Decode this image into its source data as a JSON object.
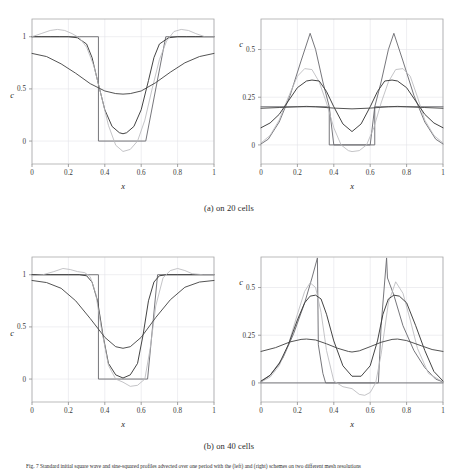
{
  "figure": {
    "subcaption_a": "(a) on 20 cells",
    "subcaption_b": "(b) on 40 cells",
    "caption_label": "Fig. 7",
    "caption_text": "Fig. 7 Standard initial square wave and sine-squared profiles advected over one period with the (left) and (right) schemes on two different mesh resolutions"
  },
  "axes": {
    "xlabel": "x",
    "ylabel": "c",
    "x_ticks": [
      "0",
      "0.2",
      "0.4",
      "0.6",
      "0.8",
      "1"
    ],
    "y_ticks_left": [
      "0",
      "0.5",
      "1"
    ],
    "y_ticks_right": [
      "0",
      "0.25",
      "0.5"
    ],
    "xlim": [
      0,
      1
    ],
    "ylim_left": [
      -0.22,
      1.17
    ],
    "ylim_right": [
      -0.1,
      0.66
    ],
    "grid": true,
    "frame_color": "#aaaaaa",
    "grid_color": "#e3e3e8"
  },
  "colors": {
    "exact": "#6f6f74",
    "compressive": "#3a3a3a",
    "oscillatory": "#b9b9bd",
    "diffusive": "#4a4a4a"
  },
  "chart_data": [
    {
      "type": "line",
      "id": "panel-top-left",
      "title": "square wave, 20 cells",
      "xlabel": "x",
      "ylabel": "c",
      "xlim": [
        0,
        1
      ],
      "ylim": [
        -0.22,
        1.17
      ],
      "x_ticks": [
        0,
        0.2,
        0.4,
        0.6,
        0.8,
        1
      ],
      "y_ticks": [
        0,
        0.5,
        1
      ],
      "grid": true,
      "legend_position": "none",
      "series": [
        {
          "name": "exact square profile",
          "color": "#6f6f74",
          "x": [
            0,
            0.26,
            0.26,
            0.365,
            0.365,
            0.625,
            0.625,
            0.735,
            0.735,
            1
          ],
          "y": [
            1,
            1,
            1,
            1,
            0,
            0,
            0,
            1,
            1,
            1
          ]
        },
        {
          "name": "compressive scheme",
          "color": "#3a3a3a",
          "x": [
            0,
            0.05,
            0.1,
            0.15,
            0.2,
            0.25,
            0.3,
            0.33,
            0.36,
            0.4,
            0.44,
            0.48,
            0.5,
            0.52,
            0.56,
            0.6,
            0.64,
            0.67,
            0.7,
            0.75,
            0.8,
            0.85,
            0.9,
            0.95,
            1
          ],
          "y": [
            1.0,
            1.0,
            1.0,
            1.0,
            1.0,
            0.99,
            0.93,
            0.8,
            0.58,
            0.3,
            0.14,
            0.08,
            0.07,
            0.08,
            0.14,
            0.3,
            0.58,
            0.8,
            0.93,
            0.99,
            1.0,
            1.0,
            1.0,
            1.0,
            1.0
          ]
        },
        {
          "name": "oscillatory scheme",
          "color": "#b9b9bd",
          "x": [
            0,
            0.05,
            0.1,
            0.14,
            0.18,
            0.22,
            0.26,
            0.3,
            0.34,
            0.38,
            0.42,
            0.46,
            0.5,
            0.54,
            0.58,
            0.62,
            0.66,
            0.7,
            0.74,
            0.78,
            0.82,
            0.86,
            0.9,
            0.95,
            1
          ],
          "y": [
            1.0,
            1.03,
            1.06,
            1.07,
            1.06,
            1.03,
            0.99,
            0.9,
            0.72,
            0.44,
            0.15,
            -0.04,
            -0.1,
            -0.08,
            0.0,
            0.2,
            0.5,
            0.78,
            0.96,
            1.05,
            1.07,
            1.06,
            1.03,
            1.0,
            1.0
          ]
        },
        {
          "name": "diffusive scheme",
          "color": "#4a4a4a",
          "x": [
            0,
            0.08,
            0.16,
            0.24,
            0.32,
            0.4,
            0.46,
            0.5,
            0.54,
            0.6,
            0.68,
            0.76,
            0.84,
            0.92,
            1
          ],
          "y": [
            0.84,
            0.81,
            0.74,
            0.65,
            0.55,
            0.48,
            0.455,
            0.45,
            0.455,
            0.48,
            0.56,
            0.66,
            0.75,
            0.81,
            0.84
          ]
        }
      ]
    },
    {
      "type": "line",
      "id": "panel-top-right",
      "title": "sine-squared profile, 20 cells",
      "xlabel": "x",
      "ylabel": "c",
      "xlim": [
        0,
        1
      ],
      "ylim": [
        -0.1,
        0.66
      ],
      "x_ticks": [
        0,
        0.2,
        0.4,
        0.6,
        0.8,
        1
      ],
      "y_ticks": [
        0,
        0.25,
        0.5
      ],
      "grid": true,
      "legend_position": "none",
      "series": [
        {
          "name": "exact square profile",
          "color": "#6f6f74",
          "x": [
            0,
            0.375,
            0.375,
            0.625,
            0.625,
            1
          ],
          "y": [
            0.2,
            0.2,
            0.0,
            0.0,
            0.2,
            0.2
          ]
        },
        {
          "name": "peaked scheme",
          "color": "#6f6f74",
          "x": [
            0,
            0.04,
            0.1,
            0.16,
            0.22,
            0.27,
            0.3,
            0.34,
            0.375,
            0.4,
            0.5,
            0.6,
            0.625,
            0.66,
            0.7,
            0.73,
            0.78,
            0.84,
            0.9,
            0.96,
            1
          ],
          "y": [
            0.005,
            0.03,
            0.12,
            0.26,
            0.44,
            0.585,
            0.5,
            0.33,
            0.2,
            0.0,
            0.0,
            0.0,
            0.2,
            0.33,
            0.5,
            0.585,
            0.44,
            0.26,
            0.12,
            0.03,
            0.005
          ]
        },
        {
          "name": "oscillatory scheme",
          "color": "#b9b9bd",
          "x": [
            0,
            0.05,
            0.1,
            0.15,
            0.2,
            0.24,
            0.28,
            0.32,
            0.36,
            0.4,
            0.44,
            0.48,
            0.5,
            0.54,
            0.58,
            0.62,
            0.66,
            0.7,
            0.74,
            0.78,
            0.82,
            0.86,
            0.9,
            0.95,
            1
          ],
          "y": [
            0.01,
            0.05,
            0.13,
            0.25,
            0.36,
            0.4,
            0.395,
            0.33,
            0.22,
            0.09,
            0.0,
            -0.03,
            -0.035,
            -0.03,
            0.0,
            0.09,
            0.22,
            0.33,
            0.395,
            0.4,
            0.36,
            0.25,
            0.13,
            0.05,
            0.01
          ]
        },
        {
          "name": "compressive scheme",
          "color": "#3a3a3a",
          "x": [
            0,
            0.05,
            0.1,
            0.15,
            0.2,
            0.25,
            0.28,
            0.32,
            0.36,
            0.4,
            0.45,
            0.5,
            0.55,
            0.6,
            0.64,
            0.68,
            0.72,
            0.75,
            0.8,
            0.85,
            0.9,
            0.95,
            1
          ],
          "y": [
            0.09,
            0.115,
            0.16,
            0.23,
            0.3,
            0.335,
            0.34,
            0.335,
            0.28,
            0.2,
            0.11,
            0.07,
            0.11,
            0.2,
            0.28,
            0.335,
            0.34,
            0.335,
            0.3,
            0.23,
            0.16,
            0.115,
            0.09
          ]
        },
        {
          "name": "diffusive scheme",
          "color": "#4a4a4a",
          "x": [
            0,
            0.1,
            0.2,
            0.25,
            0.3,
            0.4,
            0.5,
            0.6,
            0.7,
            0.75,
            0.8,
            0.9,
            1
          ],
          "y": [
            0.192,
            0.196,
            0.2,
            0.202,
            0.2,
            0.193,
            0.189,
            0.193,
            0.2,
            0.202,
            0.2,
            0.196,
            0.192
          ]
        }
      ]
    },
    {
      "type": "line",
      "id": "panel-bottom-left",
      "title": "square wave, 40 cells",
      "xlabel": "x",
      "ylabel": "c",
      "xlim": [
        0,
        1
      ],
      "ylim": [
        -0.22,
        1.17
      ],
      "x_ticks": [
        0,
        0.2,
        0.4,
        0.6,
        0.8,
        1
      ],
      "y_ticks": [
        0,
        0.5,
        1
      ],
      "grid": true,
      "legend_position": "none",
      "series": [
        {
          "name": "exact square profile",
          "color": "#6f6f74",
          "x": [
            0,
            0.31,
            0.31,
            0.365,
            0.365,
            0.635,
            0.635,
            0.69,
            0.69,
            1
          ],
          "y": [
            1,
            1,
            1,
            1,
            0,
            0,
            0,
            1,
            1,
            1
          ]
        },
        {
          "name": "compressive scheme",
          "color": "#3a3a3a",
          "x": [
            0,
            0.1,
            0.2,
            0.26,
            0.3,
            0.33,
            0.36,
            0.39,
            0.42,
            0.46,
            0.5,
            0.54,
            0.58,
            0.61,
            0.64,
            0.67,
            0.7,
            0.74,
            0.8,
            0.9,
            1
          ],
          "y": [
            1.0,
            1.0,
            1.0,
            1.0,
            0.99,
            0.93,
            0.75,
            0.42,
            0.15,
            0.04,
            0.01,
            0.04,
            0.15,
            0.42,
            0.75,
            0.93,
            0.99,
            1.0,
            1.0,
            1.0,
            1.0
          ]
        },
        {
          "name": "oscillatory scheme",
          "color": "#b9b9bd",
          "x": [
            0,
            0.06,
            0.12,
            0.17,
            0.21,
            0.25,
            0.29,
            0.32,
            0.35,
            0.38,
            0.42,
            0.46,
            0.5,
            0.54,
            0.58,
            0.62,
            0.65,
            0.68,
            0.72,
            0.76,
            0.8,
            0.84,
            0.88,
            0.94,
            1
          ],
          "y": [
            0.99,
            1.0,
            1.03,
            1.06,
            1.05,
            1.03,
            1.02,
            0.98,
            0.82,
            0.5,
            0.13,
            0.0,
            -0.03,
            -0.07,
            -0.06,
            0.0,
            0.3,
            0.7,
            0.97,
            1.04,
            1.06,
            1.04,
            1.01,
            1.0,
            1.0
          ]
        },
        {
          "name": "diffusive scheme",
          "color": "#4a4a4a",
          "x": [
            0,
            0.08,
            0.16,
            0.24,
            0.32,
            0.4,
            0.46,
            0.5,
            0.54,
            0.6,
            0.68,
            0.76,
            0.84,
            0.92,
            1
          ],
          "y": [
            0.945,
            0.925,
            0.87,
            0.75,
            0.58,
            0.4,
            0.31,
            0.295,
            0.31,
            0.4,
            0.59,
            0.76,
            0.88,
            0.93,
            0.945
          ]
        }
      ]
    },
    {
      "type": "line",
      "id": "panel-bottom-right",
      "title": "sine-squared profile, 40 cells",
      "xlabel": "x",
      "ylabel": "c",
      "xlim": [
        0,
        1
      ],
      "ylim": [
        -0.1,
        0.66
      ],
      "x_ticks": [
        0,
        0.2,
        0.4,
        0.6,
        0.8,
        1
      ],
      "y_ticks": [
        0,
        0.25,
        0.5
      ],
      "grid": true,
      "legend_position": "none",
      "series": [
        {
          "name": "exact square profile",
          "color": "#6f6f74",
          "x": [
            0,
            0.355,
            0.355,
            0.645,
            0.645,
            1
          ],
          "y": [
            0.0,
            0.0,
            0.0,
            0.0,
            0.0,
            0.0
          ]
        },
        {
          "name": "peaked scheme",
          "color": "#6f6f74",
          "x": [
            0,
            0.05,
            0.12,
            0.18,
            0.24,
            0.28,
            0.31,
            0.315,
            0.34,
            0.355,
            0.5,
            0.645,
            0.66,
            0.69,
            0.695,
            0.73,
            0.78,
            0.84,
            0.9,
            0.96,
            1
          ],
          "y": [
            0.005,
            0.04,
            0.13,
            0.26,
            0.42,
            0.55,
            0.655,
            0.2,
            0.05,
            0.0,
            0.0,
            0.0,
            0.3,
            0.655,
            0.55,
            0.46,
            0.3,
            0.17,
            0.08,
            0.02,
            0.005
          ]
        },
        {
          "name": "oscillatory scheme",
          "color": "#b9b9bd",
          "x": [
            0,
            0.05,
            0.1,
            0.15,
            0.2,
            0.24,
            0.27,
            0.3,
            0.33,
            0.36,
            0.4,
            0.45,
            0.5,
            0.54,
            0.57,
            0.6,
            0.63,
            0.66,
            0.7,
            0.74,
            0.78,
            0.82,
            0.86,
            0.92,
            1
          ],
          "y": [
            0.005,
            0.03,
            0.09,
            0.2,
            0.36,
            0.48,
            0.525,
            0.5,
            0.37,
            0.17,
            0.01,
            -0.02,
            -0.03,
            -0.06,
            -0.065,
            -0.05,
            0.0,
            0.15,
            0.42,
            0.53,
            0.47,
            0.33,
            0.18,
            0.05,
            0.005
          ]
        },
        {
          "name": "compressive scheme",
          "color": "#3a3a3a",
          "x": [
            0,
            0.05,
            0.1,
            0.15,
            0.2,
            0.24,
            0.27,
            0.3,
            0.33,
            0.36,
            0.4,
            0.45,
            0.5,
            0.55,
            0.6,
            0.64,
            0.67,
            0.7,
            0.73,
            0.76,
            0.8,
            0.85,
            0.9,
            0.95,
            1
          ],
          "y": [
            0.01,
            0.04,
            0.1,
            0.2,
            0.33,
            0.42,
            0.455,
            0.46,
            0.44,
            0.36,
            0.22,
            0.09,
            0.035,
            0.035,
            0.09,
            0.22,
            0.36,
            0.44,
            0.46,
            0.455,
            0.42,
            0.3,
            0.17,
            0.06,
            0.01
          ]
        },
        {
          "name": "diffusive scheme",
          "color": "#4a4a4a",
          "x": [
            0,
            0.08,
            0.16,
            0.22,
            0.25,
            0.3,
            0.36,
            0.42,
            0.48,
            0.5,
            0.54,
            0.6,
            0.66,
            0.72,
            0.75,
            0.8,
            0.88,
            0.94,
            1
          ],
          "y": [
            0.165,
            0.185,
            0.215,
            0.228,
            0.23,
            0.225,
            0.205,
            0.182,
            0.165,
            0.162,
            0.168,
            0.19,
            0.213,
            0.228,
            0.23,
            0.222,
            0.195,
            0.175,
            0.165
          ]
        }
      ]
    }
  ]
}
